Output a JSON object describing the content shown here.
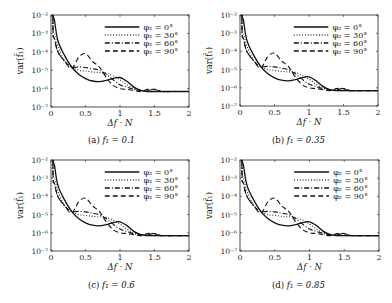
{
  "figure": {
    "xlabel": "Δf · N",
    "ylabel": "var(f̂₁)",
    "xticks": [
      "0",
      "0.5",
      "1",
      "1.5",
      "2"
    ],
    "yticks": [
      "10⁻²",
      "10⁻³",
      "10⁻⁴",
      "10⁻⁵",
      "10⁻⁶",
      "10⁻⁷"
    ],
    "legend": [
      "φ₂ = 0°",
      "φ₂ = 30°",
      "φ₂ = 60°",
      "φ₂ = 90°"
    ]
  },
  "panels": [
    {
      "label": "(a)",
      "caption_var": "f₁ = 0.1"
    },
    {
      "label": "(b)",
      "caption_var": "f₁ = 0.35"
    },
    {
      "label": "(c)",
      "caption_var": "f₁ = 0.6"
    },
    {
      "label": "(d)",
      "caption_var": "f₁ = 0.85"
    }
  ],
  "chart_data": [
    {
      "type": "line",
      "title": "(a) f1 = 0.1",
      "xlabel": "Δf · N",
      "ylabel": "var(f̂1)",
      "xlim": [
        0,
        2
      ],
      "ylim": [
        1e-07,
        0.01
      ],
      "yscale": "log",
      "grid": false,
      "legend_position": "upper right",
      "x": [
        0.03,
        0.05,
        0.1,
        0.2,
        0.3,
        0.4,
        0.5,
        0.6,
        0.7,
        0.8,
        0.9,
        1.0,
        1.1,
        1.2,
        1.3,
        1.4,
        1.5,
        1.6,
        1.8,
        2.0
      ],
      "series": [
        {
          "name": "φ2 = 0°",
          "style": "solid",
          "values": [
            0.01,
            0.005,
            0.0004,
            6e-05,
            1.5e-05,
            6e-06,
            3.5e-06,
            2.6e-06,
            2.4e-06,
            2.8e-06,
            3.6e-06,
            4e-06,
            2.5e-06,
            1.2e-06,
            8e-07,
            7e-07,
            7e-07,
            7e-07,
            7e-07,
            7e-07
          ]
        },
        {
          "name": "φ2 = 30°",
          "style": "dotted",
          "values": [
            0.002,
            0.001,
            0.0002,
            3e-05,
            1.5e-05,
            1e-05,
            9e-06,
            8e-06,
            7.5e-06,
            7e-06,
            5e-06,
            3e-06,
            1.6e-06,
            1e-06,
            8e-07,
            7e-07,
            7e-07,
            7e-07,
            7e-07,
            7e-07
          ]
        },
        {
          "name": "φ2 = 60°",
          "style": "dashdot",
          "values": [
            0.001,
            0.0005,
            0.0001,
            3e-05,
            1.5e-05,
            1.5e-05,
            1.4e-05,
            1.2e-05,
            1e-05,
            6e-06,
            3e-06,
            1.6e-06,
            1.2e-06,
            9e-07,
            8e-07,
            8e-07,
            9e-07,
            7e-07,
            7e-07,
            7e-07
          ]
        },
        {
          "name": "φ2 = 90°",
          "style": "dashed",
          "values": [
            0.001,
            0.0005,
            0.0001,
            3e-05,
            1.2e-05,
            5e-05,
            8e-05,
            3e-05,
            1.5e-05,
            4e-06,
            1.5e-06,
            1e-06,
            9e-07,
            8e-07,
            7e-07,
            9e-07,
            9e-07,
            7e-07,
            7e-07,
            7e-07
          ]
        }
      ]
    },
    {
      "type": "line",
      "title": "(b) f1 = 0.35",
      "xlabel": "Δf · N",
      "ylabel": "var(f̂1)",
      "xlim": [
        0,
        2
      ],
      "ylim": [
        1e-07,
        0.01
      ],
      "yscale": "log",
      "grid": false,
      "legend_position": "upper right",
      "x": [
        0.03,
        0.05,
        0.1,
        0.2,
        0.3,
        0.4,
        0.5,
        0.6,
        0.7,
        0.8,
        0.9,
        1.0,
        1.1,
        1.2,
        1.3,
        1.4,
        1.5,
        1.6,
        1.8,
        2.0
      ],
      "series": [
        {
          "name": "φ2 = 0°",
          "style": "solid",
          "values": [
            0.01,
            0.005,
            0.0004,
            6e-05,
            1.5e-05,
            6e-06,
            3.5e-06,
            2.6e-06,
            2.4e-06,
            2.8e-06,
            3.6e-06,
            4e-06,
            2.5e-06,
            1.2e-06,
            8e-07,
            7e-07,
            7e-07,
            7e-07,
            7e-07,
            7e-07
          ]
        },
        {
          "name": "φ2 = 30°",
          "style": "dotted",
          "values": [
            0.002,
            0.001,
            0.0002,
            3e-05,
            1.5e-05,
            1e-05,
            9e-06,
            8e-06,
            7.5e-06,
            7e-06,
            5e-06,
            3e-06,
            1.6e-06,
            1e-06,
            8e-07,
            7e-07,
            7e-07,
            7e-07,
            7e-07,
            7e-07
          ]
        },
        {
          "name": "φ2 = 60°",
          "style": "dashdot",
          "values": [
            0.001,
            0.0005,
            0.0001,
            3e-05,
            1.5e-05,
            1.5e-05,
            1.4e-05,
            1.2e-05,
            1e-05,
            6e-06,
            3e-06,
            1.6e-06,
            1.2e-06,
            9e-07,
            8e-07,
            8e-07,
            9e-07,
            7e-07,
            7e-07,
            7e-07
          ]
        },
        {
          "name": "φ2 = 90°",
          "style": "dashed",
          "values": [
            0.001,
            0.0005,
            0.0001,
            3e-05,
            1.2e-05,
            5e-05,
            8e-05,
            3e-05,
            1.5e-05,
            4e-06,
            1.5e-06,
            1e-06,
            9e-07,
            8e-07,
            7e-07,
            9e-07,
            9e-07,
            7e-07,
            7e-07,
            7e-07
          ]
        }
      ]
    },
    {
      "type": "line",
      "title": "(c) f1 = 0.6",
      "xlabel": "Δf · N",
      "ylabel": "var(f̂1)",
      "xlim": [
        0,
        2
      ],
      "ylim": [
        1e-07,
        0.01
      ],
      "yscale": "log",
      "grid": false,
      "legend_position": "upper right",
      "x": [
        0.03,
        0.05,
        0.1,
        0.2,
        0.3,
        0.4,
        0.5,
        0.6,
        0.7,
        0.8,
        0.9,
        1.0,
        1.1,
        1.2,
        1.3,
        1.4,
        1.5,
        1.6,
        1.8,
        2.0
      ],
      "series": [
        {
          "name": "φ2 = 0°",
          "style": "solid",
          "values": [
            0.01,
            0.005,
            0.0004,
            6e-05,
            1.5e-05,
            6e-06,
            3.5e-06,
            2.6e-06,
            2.4e-06,
            2.8e-06,
            3.6e-06,
            4e-06,
            2.5e-06,
            1.2e-06,
            8e-07,
            7e-07,
            7e-07,
            7e-07,
            7e-07,
            7e-07
          ]
        },
        {
          "name": "φ2 = 30°",
          "style": "dotted",
          "values": [
            0.002,
            0.001,
            0.0002,
            3e-05,
            1.5e-05,
            1e-05,
            9e-06,
            8e-06,
            7.5e-06,
            7e-06,
            5e-06,
            3e-06,
            1.6e-06,
            1e-06,
            8e-07,
            7e-07,
            7e-07,
            7e-07,
            7e-07,
            7e-07
          ]
        },
        {
          "name": "φ2 = 60°",
          "style": "dashdot",
          "values": [
            0.001,
            0.0005,
            0.0001,
            3e-05,
            1.5e-05,
            1.5e-05,
            1.4e-05,
            1.2e-05,
            1e-05,
            6e-06,
            3e-06,
            1.6e-06,
            1.2e-06,
            9e-07,
            8e-07,
            8e-07,
            9e-07,
            7e-07,
            7e-07,
            7e-07
          ]
        },
        {
          "name": "φ2 = 90°",
          "style": "dashed",
          "values": [
            0.001,
            0.0005,
            0.0001,
            3e-05,
            1.2e-05,
            5e-05,
            8e-05,
            3e-05,
            1.5e-05,
            4e-06,
            1.5e-06,
            1e-06,
            9e-07,
            8e-07,
            7e-07,
            9e-07,
            9e-07,
            7e-07,
            7e-07,
            7e-07
          ]
        }
      ]
    },
    {
      "type": "line",
      "title": "(d) f1 = 0.85",
      "xlabel": "Δf · N",
      "ylabel": "var(f̂1)",
      "xlim": [
        0,
        2
      ],
      "ylim": [
        1e-07,
        0.01
      ],
      "yscale": "log",
      "grid": false,
      "legend_position": "upper right",
      "x": [
        0.03,
        0.05,
        0.1,
        0.2,
        0.3,
        0.4,
        0.5,
        0.6,
        0.7,
        0.8,
        0.9,
        1.0,
        1.1,
        1.2,
        1.3,
        1.4,
        1.5,
        1.6,
        1.8,
        2.0
      ],
      "series": [
        {
          "name": "φ2 = 0°",
          "style": "solid",
          "values": [
            0.01,
            0.005,
            0.0004,
            6e-05,
            1.5e-05,
            6e-06,
            3.5e-06,
            2.6e-06,
            2.4e-06,
            2.8e-06,
            3.6e-06,
            4e-06,
            2.5e-06,
            1.2e-06,
            8e-07,
            7e-07,
            7e-07,
            7e-07,
            7e-07,
            7e-07
          ]
        },
        {
          "name": "φ2 = 30°",
          "style": "dotted",
          "values": [
            0.002,
            0.001,
            0.0002,
            3e-05,
            1.5e-05,
            1e-05,
            9e-06,
            8e-06,
            7.5e-06,
            7e-06,
            5e-06,
            3e-06,
            1.6e-06,
            1e-06,
            8e-07,
            7e-07,
            7e-07,
            7e-07,
            7e-07,
            7e-07
          ]
        },
        {
          "name": "φ2 = 60°",
          "style": "dashdot",
          "values": [
            0.001,
            0.0005,
            0.0001,
            3e-05,
            1.5e-05,
            1.5e-05,
            1.4e-05,
            1.2e-05,
            1e-05,
            6e-06,
            3e-06,
            1.6e-06,
            1.2e-06,
            9e-07,
            8e-07,
            8e-07,
            9e-07,
            7e-07,
            7e-07,
            7e-07
          ]
        },
        {
          "name": "φ2 = 90°",
          "style": "dashed",
          "values": [
            0.001,
            0.0005,
            0.0001,
            3e-05,
            1.2e-05,
            5e-05,
            8e-05,
            3e-05,
            1.5e-05,
            4e-06,
            1.5e-06,
            1e-06,
            9e-07,
            8e-07,
            7e-07,
            9e-07,
            9e-07,
            7e-07,
            7e-07,
            7e-07
          ]
        }
      ]
    }
  ]
}
